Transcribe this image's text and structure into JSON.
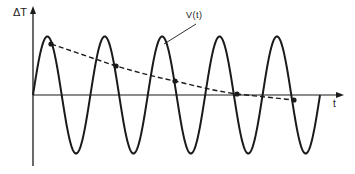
{
  "diagram": {
    "title": "",
    "y_axis_label": "ΔT",
    "x_axis_label": "t",
    "curve_label": "V(t)",
    "colors": {
      "stroke": "#1a1a1a",
      "background": "#ffffff"
    }
  },
  "chart_data": {
    "type": "line",
    "title": "",
    "xlabel": "t",
    "ylabel": "ΔT",
    "grid": false,
    "legend": "none",
    "series": [
      {
        "name": "ΔT oscillation",
        "style": "solid",
        "description": "sinusoid of constant amplitude, 5 full cycles starting at origin",
        "cycles": 5,
        "amplitude": 1.0
      },
      {
        "name": "V(t)",
        "style": "dashed",
        "description": "decaying curve through marked points on the oscillation",
        "points_relative": [
          {
            "cycle": 1,
            "value": 0.87
          },
          {
            "cycle": 2,
            "value": 0.5
          },
          {
            "cycle": 3,
            "value": 0.24
          },
          {
            "cycle": 4,
            "value": 0.02
          },
          {
            "cycle": 5,
            "value": -0.08
          }
        ]
      }
    ]
  }
}
